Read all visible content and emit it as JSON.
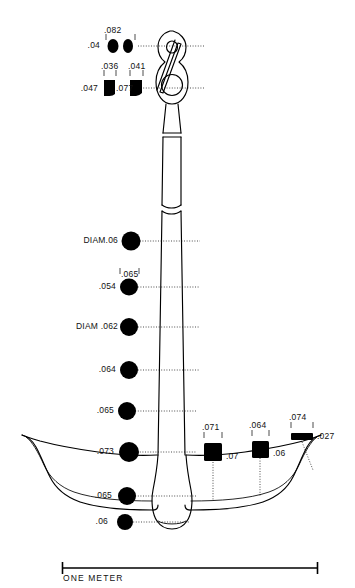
{
  "figure": {
    "type": "archaeological-line-drawing",
    "background_color": "#ffffff",
    "ink_color": "#000000"
  },
  "scale_bar": {
    "caption": "ONE METER",
    "x_start": 62,
    "x_end": 318,
    "y": 568
  },
  "sections": {
    "top_pair_upper": {
      "span_label": ".082",
      "left_label": ".04",
      "shapes": [
        "oval",
        "oval"
      ]
    },
    "top_pair_lower": {
      "left_label": ".047",
      "mid_label": ".077",
      "above_left_label": ".036",
      "above_right_label": ".041",
      "shapes": [
        "rounded-square",
        "rounded-square"
      ]
    }
  },
  "left_column": [
    {
      "name": "section-diam-06",
      "label": "DIAM.06",
      "above": "",
      "shape": "circle",
      "d": 19,
      "cy": 241
    },
    {
      "name": "section-054",
      "label": ".054",
      "above": ".065",
      "shape": "ellipse",
      "d": 17,
      "cy": 287
    },
    {
      "name": "section-diam-062",
      "label": "DIAM .062",
      "above": "",
      "shape": "circle",
      "d": 18,
      "cy": 327
    },
    {
      "name": "section-064",
      "label": ".064",
      "above": "",
      "shape": "circle",
      "d": 18,
      "cy": 370
    },
    {
      "name": "section-065-a",
      "label": ".065",
      "above": "",
      "shape": "circle",
      "d": 18,
      "cy": 411
    },
    {
      "name": "section-073",
      "label": ".073",
      "above": "",
      "shape": "circle",
      "d": 20,
      "cy": 452
    },
    {
      "name": "section-065-b",
      "label": ".065",
      "above": "",
      "shape": "circle",
      "d": 18,
      "cy": 496
    },
    {
      "name": "section-06",
      "label": ".06",
      "above": "",
      "shape": "circle",
      "d": 16,
      "cy": 522
    }
  ],
  "right_column": [
    {
      "name": "section-071",
      "above": ".071",
      "right": ".07",
      "shape": "square",
      "cx": 213,
      "cy": 452,
      "w": 18,
      "h": 17
    },
    {
      "name": "section-064",
      "above": ".064",
      "right": ".06",
      "shape": "square",
      "cx": 260,
      "cy": 449,
      "w": 17,
      "h": 16
    },
    {
      "name": "section-074",
      "above": ".074",
      "right": ".027",
      "shape": "thin-bar",
      "cx": 302,
      "cy": 437,
      "w": 22,
      "h": 7
    }
  ]
}
